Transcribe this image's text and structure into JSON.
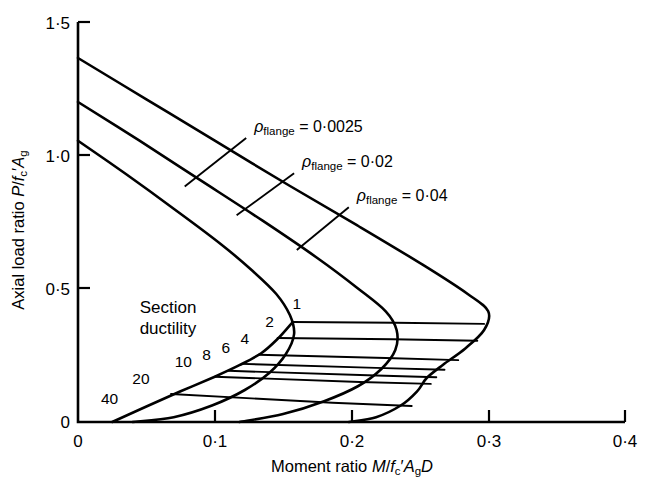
{
  "chart_data": {
    "type": "line",
    "title": "",
    "xlabel": "Moment ratio M/fc'AgD",
    "ylabel": "Axial load ratio P/fc'Ag",
    "xlim": [
      0,
      0.4
    ],
    "ylim": [
      0,
      1.5
    ],
    "xticks": [
      "0",
      "0·1",
      "0·2",
      "0·3",
      "0·4"
    ],
    "xtick_values": [
      0,
      0.1,
      0.2,
      0.3,
      0.4
    ],
    "yticks": [
      "0",
      "0·5",
      "1·0",
      "1·5"
    ],
    "ytick_values": [
      0,
      0.5,
      1.0,
      1.5
    ],
    "grid": false,
    "legend": "inline-annotations",
    "series": [
      {
        "name": "ρflange = 0·0025",
        "label": "ρflange = 0·0025",
        "rho": 0.0025,
        "points": [
          [
            0.0,
            1.055
          ],
          [
            0.035,
            0.93
          ],
          [
            0.07,
            0.8
          ],
          [
            0.105,
            0.665
          ],
          [
            0.128,
            0.565
          ],
          [
            0.145,
            0.48
          ],
          [
            0.155,
            0.4
          ],
          [
            0.158,
            0.33
          ],
          [
            0.152,
            0.255
          ],
          [
            0.14,
            0.185
          ],
          [
            0.122,
            0.12
          ],
          [
            0.098,
            0.062
          ],
          [
            0.07,
            0.018
          ],
          [
            0.04,
            0.0
          ]
        ]
      },
      {
        "name": "ρflange = 0·02",
        "label": "ρflange = 0·02",
        "rho": 0.02,
        "points": [
          [
            0.0,
            1.2
          ],
          [
            0.045,
            1.055
          ],
          [
            0.09,
            0.905
          ],
          [
            0.135,
            0.755
          ],
          [
            0.175,
            0.615
          ],
          [
            0.205,
            0.5
          ],
          [
            0.225,
            0.415
          ],
          [
            0.233,
            0.345
          ],
          [
            0.232,
            0.27
          ],
          [
            0.222,
            0.2
          ],
          [
            0.205,
            0.135
          ],
          [
            0.18,
            0.078
          ],
          [
            0.15,
            0.03
          ],
          [
            0.118,
            0.0
          ]
        ]
      },
      {
        "name": "ρflange = 0·04",
        "label": "ρflange = 0·04",
        "rho": 0.04,
        "points": [
          [
            0.0,
            1.365
          ],
          [
            0.05,
            1.21
          ],
          [
            0.1,
            1.055
          ],
          [
            0.155,
            0.885
          ],
          [
            0.205,
            0.735
          ],
          [
            0.252,
            0.59
          ],
          [
            0.285,
            0.48
          ],
          [
            0.3,
            0.415
          ],
          [
            0.297,
            0.345
          ],
          [
            0.283,
            0.275
          ],
          [
            0.267,
            0.215
          ],
          [
            0.255,
            0.165
          ],
          [
            0.248,
            0.115
          ],
          [
            0.236,
            0.062
          ],
          [
            0.218,
            0.018
          ],
          [
            0.198,
            0.0
          ]
        ]
      }
    ],
    "ductility_label": [
      "Section",
      "ductility"
    ],
    "ductility_values": [
      "1",
      "2",
      "4",
      "6",
      "8",
      "10",
      "20",
      "40"
    ],
    "ductility_contours": [
      {
        "value": "1",
        "points": [
          [
            0.157,
            0.375
          ],
          [
            0.232,
            0.372
          ],
          [
            0.297,
            0.368
          ]
        ],
        "label_xy": [
          0.16,
          0.425
        ]
      },
      {
        "value": "2",
        "points": [
          [
            0.146,
            0.315
          ],
          [
            0.23,
            0.31
          ],
          [
            0.292,
            0.305
          ]
        ],
        "label_xy": [
          0.14,
          0.358
        ]
      },
      {
        "value": "4",
        "points": [
          [
            0.132,
            0.252
          ],
          [
            0.225,
            0.24
          ],
          [
            0.278,
            0.232
          ]
        ],
        "label_xy": [
          0.122,
          0.292
        ]
      },
      {
        "value": "6",
        "points": [
          [
            0.12,
            0.218
          ],
          [
            0.218,
            0.203
          ],
          [
            0.268,
            0.196
          ]
        ],
        "label_xy": [
          0.108,
          0.258
        ]
      },
      {
        "value": "8",
        "points": [
          [
            0.11,
            0.192
          ],
          [
            0.212,
            0.175
          ],
          [
            0.262,
            0.168
          ]
        ],
        "label_xy": [
          0.094,
          0.232
        ]
      },
      {
        "value": "10",
        "points": [
          [
            0.1,
            0.17
          ],
          [
            0.206,
            0.15
          ],
          [
            0.258,
            0.143
          ]
        ],
        "label_xy": [
          0.077,
          0.208
        ]
      },
      {
        "value": "20",
        "points": [
          [
            0.068,
            0.105
          ],
          [
            0.186,
            0.072
          ],
          [
            0.244,
            0.06
          ]
        ],
        "label_xy": [
          0.046,
          0.142
        ]
      },
      {
        "value": "40",
        "points": [
          [
            0.03,
            0.0
          ],
          [
            0.15,
            0.0
          ],
          [
            0.218,
            0.0
          ]
        ],
        "label_xy": [
          0.023,
          0.068
        ]
      }
    ],
    "ductility_envelope": [
      [
        0.025,
        0.0
      ],
      [
        0.05,
        0.058
      ],
      [
        0.075,
        0.115
      ],
      [
        0.1,
        0.17
      ],
      [
        0.118,
        0.213
      ],
      [
        0.134,
        0.258
      ],
      [
        0.146,
        0.312
      ],
      [
        0.157,
        0.375
      ]
    ],
    "annotations": [
      {
        "text": "ρflange = 0·0025",
        "x": 0.123,
        "y": 1.088,
        "leader_to": [
          0.078,
          0.883
        ]
      },
      {
        "text": "ρflange = 0·02",
        "x": 0.158,
        "y": 0.955,
        "leader_to": [
          0.116,
          0.775
        ]
      },
      {
        "text": "ρflange = 0·04",
        "x": 0.198,
        "y": 0.828,
        "leader_to": [
          0.16,
          0.645
        ]
      }
    ]
  }
}
